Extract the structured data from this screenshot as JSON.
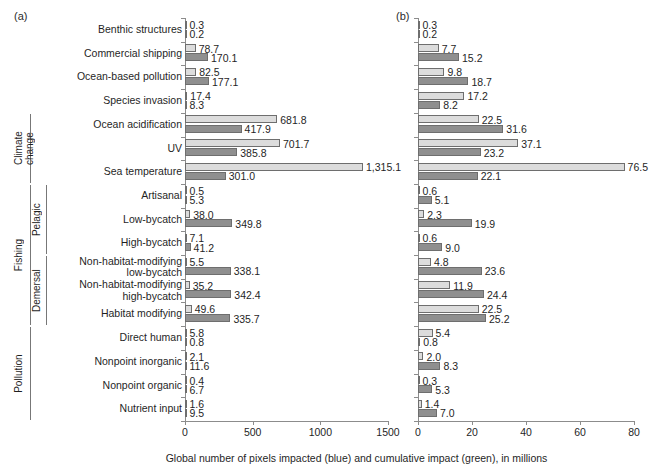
{
  "panels": {
    "a_tag": "(a)",
    "b_tag": "(b)"
  },
  "axis_caption": "Global number of pixels impacted (blue) and cumulative impact (green), in millions",
  "colors": {
    "light_bar": "#dcdcdc",
    "dark_bar": "#8f8f8f",
    "bar_outline": "#6e6e6e",
    "axis": "#8c8c8c",
    "text": "#1f1f1f"
  },
  "groups": [
    {
      "label": "Climate\nchange",
      "first_row": 4,
      "last_row": 6
    },
    {
      "label": "Fishing",
      "first_row": 7,
      "last_row": 12
    },
    {
      "label": "Pelagic",
      "first_row": 7,
      "last_row": 9
    },
    {
      "label": "Demersal",
      "first_row": 10,
      "last_row": 12
    },
    {
      "label": "Pollution",
      "first_row": 13,
      "last_row": 16
    }
  ],
  "chart_data": {
    "type": "bar",
    "orientation": "horizontal",
    "title": "",
    "xlabel": "Global number of pixels impacted (blue) and cumulative impact (green), in millions",
    "ylabel": "",
    "grid": false,
    "legend_position": "none",
    "categories": [
      "Benthic structures",
      "Commercial shipping",
      "Ocean-based pollution",
      "Species invasion",
      "Ocean acidification",
      "UV",
      "Sea temperature",
      "Artisanal",
      "Low-bycatch",
      "High-bycatch",
      "Non-habitat-modifying\nlow-bycatch",
      "Non-habitat-modifying\nhigh-bycatch",
      "Habitat modifying",
      "Direct human",
      "Nonpoint inorganic",
      "Nonpoint organic",
      "Nutrient input"
    ],
    "panels": [
      {
        "tag": "(a)",
        "xlim": [
          0,
          1500
        ],
        "xticks": [
          0,
          500,
          1000,
          1500
        ],
        "xtick_labels": [
          "0",
          "500",
          "1000",
          "1500"
        ],
        "series": [
          {
            "name": "Global number of pixels impacted",
            "style": "light",
            "values": [
              0.3,
              78.7,
              82.5,
              17.4,
              681.8,
              701.7,
              1315.1,
              0.5,
              38.0,
              7.1,
              5.5,
              35.2,
              49.6,
              5.8,
              2.1,
              0.4,
              1.6
            ],
            "labels": [
              "0.3",
              "78.7",
              "82.5",
              "17.4",
              "681.8",
              "701.7",
              "1,315.1",
              "0.5",
              "38.0",
              "7.1",
              "5.5",
              "35.2",
              "49.6",
              "5.8",
              "2.1",
              "0.4",
              "1.6"
            ]
          },
          {
            "name": "Cumulative impact",
            "style": "dark",
            "values": [
              0.2,
              170.1,
              177.1,
              8.3,
              417.9,
              385.8,
              301.0,
              5.3,
              349.8,
              41.2,
              338.1,
              342.4,
              335.7,
              0.8,
              11.6,
              6.7,
              9.5
            ],
            "labels": [
              "0.2",
              "170.1",
              "177.1",
              "8.3",
              "417.9",
              "385.8",
              "301.0",
              "5.3",
              "349.8",
              "41.2",
              "338.1",
              "342.4",
              "335.7",
              "0.8",
              "11.6",
              "6.7",
              "9.5"
            ]
          }
        ]
      },
      {
        "tag": "(b)",
        "xlim": [
          0,
          80
        ],
        "xticks": [
          0,
          20,
          40,
          60,
          80
        ],
        "xtick_labels": [
          "0",
          "20",
          "40",
          "60",
          "80"
        ],
        "series": [
          {
            "name": "Global number of pixels impacted",
            "style": "light",
            "values": [
              0.3,
              7.7,
              9.8,
              17.2,
              22.5,
              37.1,
              76.5,
              0.6,
              2.3,
              0.6,
              4.8,
              11.9,
              22.5,
              5.4,
              2.0,
              0.3,
              1.4
            ],
            "labels": [
              "0.3",
              "7.7",
              "9.8",
              "17.2",
              "22.5",
              "37.1",
              "76.5",
              "0.6",
              "2.3",
              "0.6",
              "4.8",
              "11.9",
              "22.5",
              "5.4",
              "2.0",
              "0.3",
              "1.4"
            ]
          },
          {
            "name": "Cumulative impact",
            "style": "dark",
            "values": [
              0.2,
              15.2,
              18.7,
              8.2,
              31.6,
              23.2,
              22.1,
              5.1,
              19.9,
              9.0,
              23.6,
              24.4,
              25.2,
              0.8,
              8.3,
              5.3,
              7.0
            ],
            "labels": [
              "0.2",
              "15.2",
              "18.7",
              "8.2",
              "31.6",
              "23.2",
              "22.1",
              "5.1",
              "19.9",
              "9.0",
              "23.6",
              "24.4",
              "25.2",
              "0.8",
              "8.3",
              "5.3",
              "7.0"
            ]
          }
        ]
      }
    ]
  }
}
